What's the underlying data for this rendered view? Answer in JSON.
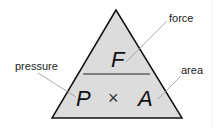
{
  "diagram": {
    "type": "formula-triangle",
    "top": {
      "symbol": "F",
      "label": "force"
    },
    "bottom_left": {
      "symbol": "P",
      "label": "pressure"
    },
    "operator": "×",
    "bottom_right": {
      "symbol": "A",
      "label": "area"
    },
    "colors": {
      "fill": "#dcdcdc",
      "stroke": "#111111",
      "leader": "#999999"
    }
  }
}
